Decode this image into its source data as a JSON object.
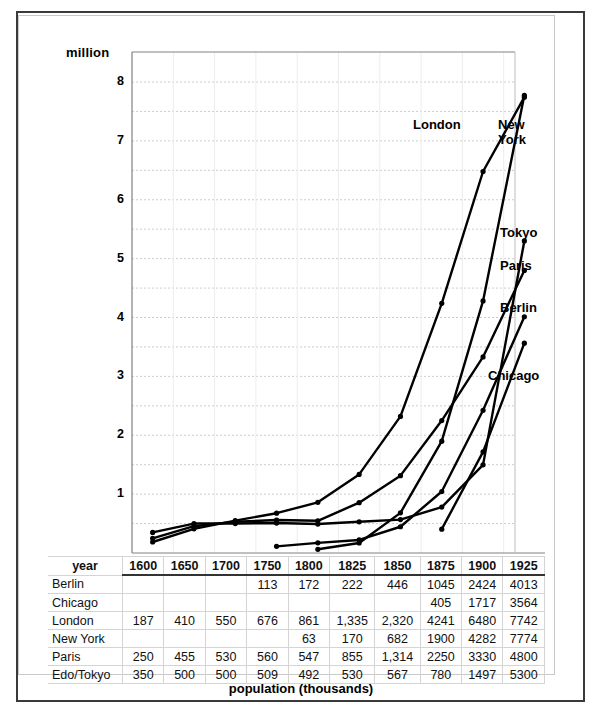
{
  "axis_unit_label": "million",
  "caption": "population (thousands)",
  "year_header_label": "year",
  "chart_data": {
    "type": "line",
    "title": "",
    "xlabel": "year",
    "ylabel": "million",
    "ylim": [
      0,
      8.5
    ],
    "yticks": [
      1,
      2,
      3,
      4,
      5,
      6,
      7,
      8
    ],
    "ytick_labels": [
      "1",
      "2",
      "3",
      "4",
      "5",
      "6",
      "7",
      "8"
    ],
    "gridlines": [
      0.5,
      1,
      1.5,
      2,
      2.5,
      3,
      3.5,
      4,
      4.5,
      5,
      5.5,
      6,
      6.5,
      7,
      7.5,
      8
    ],
    "grid": true,
    "legend_position": "inline-right",
    "units_note": "table values are thousands; axis is millions",
    "categories": [
      "1600",
      "1650",
      "1700",
      "1750",
      "1800",
      "1825",
      "1850",
      "1875",
      "1900",
      "1925"
    ],
    "series": [
      {
        "name": "Berlin",
        "label": "Berlin",
        "values": [
          null,
          null,
          null,
          113,
          172,
          222,
          446,
          1045,
          2424,
          4013
        ]
      },
      {
        "name": "Chicago",
        "label": "Chicago",
        "values": [
          null,
          null,
          null,
          null,
          null,
          null,
          null,
          405,
          1717,
          3564
        ]
      },
      {
        "name": "London",
        "label": "London",
        "values": [
          187,
          410,
          550,
          676,
          861,
          1335,
          2320,
          4241,
          6480,
          7742
        ]
      },
      {
        "name": "New York",
        "label": "New York",
        "values": [
          null,
          null,
          null,
          null,
          63,
          170,
          682,
          1900,
          4282,
          7774
        ]
      },
      {
        "name": "Paris",
        "label": "Paris",
        "values": [
          250,
          455,
          530,
          560,
          547,
          855,
          1314,
          2250,
          3330,
          4800
        ]
      },
      {
        "name": "Edo/Tokyo",
        "label": "Tokyo",
        "values": [
          350,
          500,
          500,
          509,
          492,
          530,
          567,
          780,
          1497,
          5300
        ]
      }
    ],
    "series_text_values": [
      {
        "name": "Berlin",
        "cells": [
          "",
          "",
          "",
          "113",
          "172",
          "222",
          "446",
          "1045",
          "2424",
          "4013"
        ]
      },
      {
        "name": "Chicago",
        "cells": [
          "",
          "",
          "",
          "",
          "",
          "",
          "",
          "405",
          "1717",
          "3564"
        ]
      },
      {
        "name": "London",
        "cells": [
          "187",
          "410",
          "550",
          "676",
          "861",
          "1,335",
          "2,320",
          "4241",
          "6480",
          "7742"
        ]
      },
      {
        "name": "New York",
        "cells": [
          "",
          "",
          "",
          "",
          "63",
          "170",
          "682",
          "1900",
          "4282",
          "7774"
        ]
      },
      {
        "name": "Paris",
        "cells": [
          "250",
          "455",
          "530",
          "560",
          "547",
          "855",
          "1,314",
          "2250",
          "3330",
          "4800"
        ]
      },
      {
        "name": "Edo/Tokyo",
        "cells": [
          "350",
          "500",
          "500",
          "509",
          "492",
          "530",
          "567",
          "780",
          "1497",
          "5300"
        ]
      }
    ],
    "annotations": [
      {
        "text": "London",
        "x": 413,
        "y": 117
      },
      {
        "text": "New\nYork",
        "x": 498,
        "y": 117
      },
      {
        "text": "Tokyo",
        "x": 500,
        "y": 225
      },
      {
        "text": "Paris",
        "x": 500,
        "y": 258
      },
      {
        "text": "Berlin",
        "x": 500,
        "y": 300
      },
      {
        "text": "Chicago",
        "x": 488,
        "y": 368
      }
    ],
    "colors": {
      "line": "#000000",
      "grid": "#cccccc",
      "axis": "#808080",
      "table_border": "#d4d4d4"
    }
  }
}
